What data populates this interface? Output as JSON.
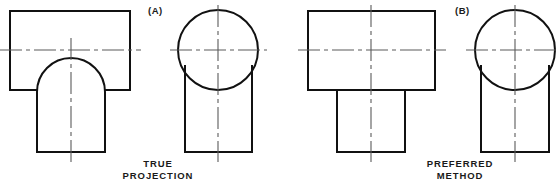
{
  "figure": {
    "title_implied": "Orthographic projection of a cylindrical boss on a rectangular block",
    "background_color": "#ffffff",
    "object_line_color": "#111111",
    "center_line_color": "#5b5b5b"
  },
  "panels": [
    {
      "id": "panel-a",
      "tag": "(A)",
      "caption_line1": "TRUE",
      "caption_line2": "PROJECTION",
      "views": [
        {
          "name": "front-view-a",
          "description": "rectangular block with domed cylindrical boss below",
          "block": {
            "x": 10,
            "y": 11,
            "width": 120,
            "height": 79
          },
          "boss": {
            "left": 37,
            "right": 105,
            "bottom": 152,
            "arc_radius": 34,
            "arc_top": 78
          }
        },
        {
          "name": "side-view-a",
          "description": "circle tangent to vertical sides of lower rectangle",
          "circle": {
            "cx": 218,
            "cy": 50,
            "r": 40
          },
          "body": {
            "left": 185,
            "right": 252,
            "bottom": 152
          }
        }
      ]
    },
    {
      "id": "panel-b",
      "tag": "(B)",
      "caption_line1": "PREFERRED",
      "caption_line2": "METHOD",
      "views": [
        {
          "name": "front-view-b",
          "description": "rectangular block with plain rectangular boss below",
          "block": {
            "x": 308,
            "y": 11,
            "width": 127,
            "height": 79
          },
          "boss": {
            "left": 337,
            "right": 405,
            "top": 90,
            "bottom": 152
          }
        },
        {
          "name": "side-view-b",
          "description": "circle tangent to vertical sides of lower rectangle",
          "circle": {
            "cx": 515,
            "cy": 50,
            "r": 40
          },
          "body": {
            "left": 481,
            "right": 549,
            "bottom": 152
          }
        }
      ]
    }
  ],
  "center_lines": {
    "horizontal_y": 50,
    "note": "horizontal and vertical dash-dot construction lines through each view"
  }
}
